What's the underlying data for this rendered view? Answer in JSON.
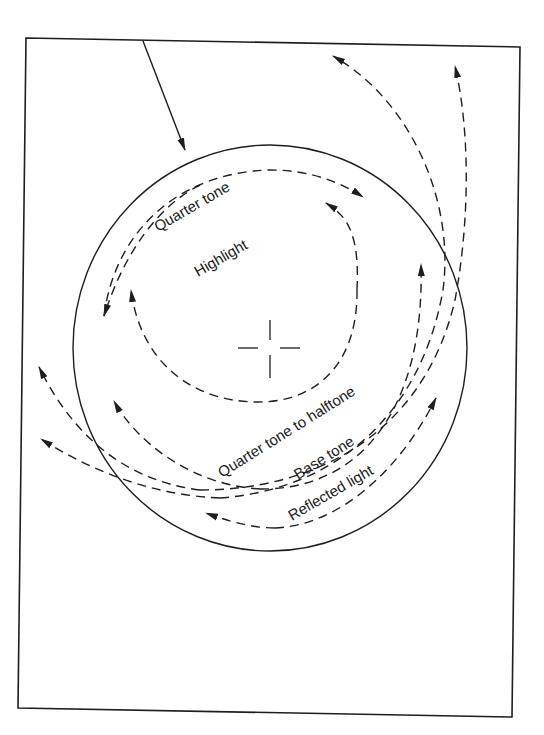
{
  "diagram": {
    "type": "lighting-on-sphere",
    "labels": {
      "quarter_tone": "Quarter tone",
      "highlight": "Highlight",
      "quarter_to_halftone": "Quarter tone to halftone",
      "base_tone": "Base tone",
      "reflected_light": "Reflected light"
    },
    "elements": {
      "light_direction_arrow": "solid arrow from top edge pointing to sphere",
      "sphere_outline": "solid circle",
      "center_mark": "dashed crosshair at sphere center",
      "tone_arcs": "dashed curved arrows showing tonal zones"
    },
    "colors": {
      "ink": "#1e1e1e",
      "paper": "#ffffff"
    }
  }
}
